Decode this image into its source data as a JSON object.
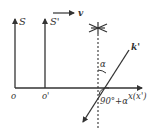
{
  "diagram": {
    "colors": {
      "line": "#333333",
      "background": "#ffffff"
    },
    "frames": {
      "S": {
        "label": "S",
        "origin_label": "o"
      },
      "S_prime": {
        "label": "S'",
        "origin_label": "o'"
      }
    },
    "x_axis": {
      "label": "x(x')"
    },
    "velocity": {
      "label": "v"
    },
    "wave_vector": {
      "label": "k'"
    },
    "angles": {
      "alpha": "α",
      "ninety_plus_alpha": "90°+α"
    },
    "source": {
      "icon": "star-icon"
    }
  }
}
